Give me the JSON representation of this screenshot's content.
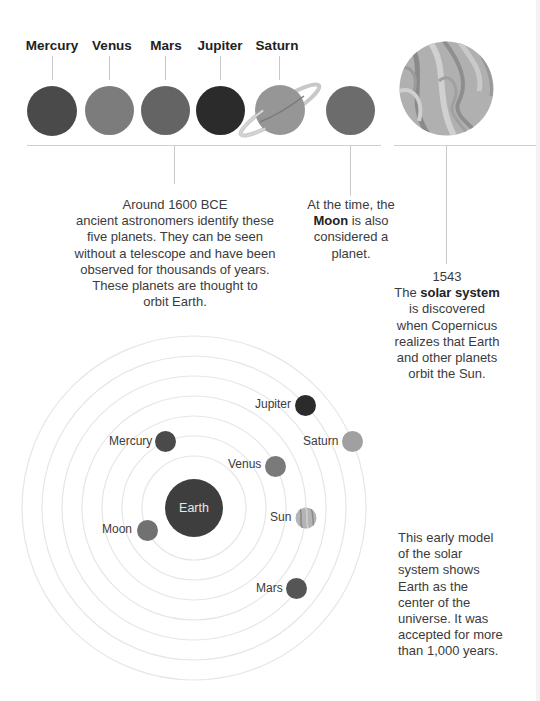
{
  "timeline": {
    "top_labels": [
      {
        "name": "Mercury",
        "x": 52
      },
      {
        "name": "Venus",
        "x": 110
      },
      {
        "name": "Mars",
        "x": 165
      },
      {
        "name": "Jupiter",
        "x": 220
      },
      {
        "name": "Saturn",
        "x": 278
      }
    ],
    "planets": [
      {
        "name": "Mercury",
        "color": "#4a4a4a"
      },
      {
        "name": "Venus",
        "color": "#7c7c7c"
      },
      {
        "name": "Mars",
        "color": "#646464"
      },
      {
        "name": "Jupiter",
        "color": "#2b2b2b"
      },
      {
        "name": "Saturn",
        "color": "#969696"
      },
      {
        "name": "Moon",
        "color": "#6c6c6c"
      },
      {
        "name": "Sun",
        "color": "#a8a8a8"
      }
    ],
    "note_planets": {
      "line1": "Around 1600 BCE",
      "line2": "ancient astronomers identify these",
      "line3": "five planets. They can be seen",
      "line4": "without a telescope and have been",
      "line5": "observed for thousands of years.",
      "line6": "These planets are thought to",
      "line7": "orbit Earth."
    },
    "note_moon": {
      "line1": "At the time, the",
      "bold": "Moon",
      "line2_rest": " is also",
      "line3": "considered a",
      "line4": "planet."
    },
    "note_solar": {
      "year": "1543",
      "pre": "The ",
      "bold": "solar system",
      "line3": "is discovered",
      "line4": "when Copernicus",
      "line5": "realizes that Earth",
      "line6": "and other planets",
      "line7": "orbit the Sun."
    }
  },
  "model": {
    "center_label": "Earth",
    "bodies": [
      {
        "label": "Jupiter",
        "color": "#2b2b2b"
      },
      {
        "label": "Saturn",
        "color": "#a0a0a0"
      },
      {
        "label": "Mercury",
        "color": "#4a4a4a"
      },
      {
        "label": "Venus",
        "color": "#7a7a7a"
      },
      {
        "label": "Sun",
        "color": "#a8a8a8"
      },
      {
        "label": "Moon",
        "color": "#717171"
      },
      {
        "label": "Mars",
        "color": "#555555"
      }
    ],
    "caption": {
      "line1": "This early model",
      "line2": "of the solar",
      "line3": "system shows",
      "line4": "Earth as the",
      "line5": "center of the",
      "line6": "universe. It was",
      "line7": "accepted for more",
      "line8": "than 1,000 years."
    }
  }
}
